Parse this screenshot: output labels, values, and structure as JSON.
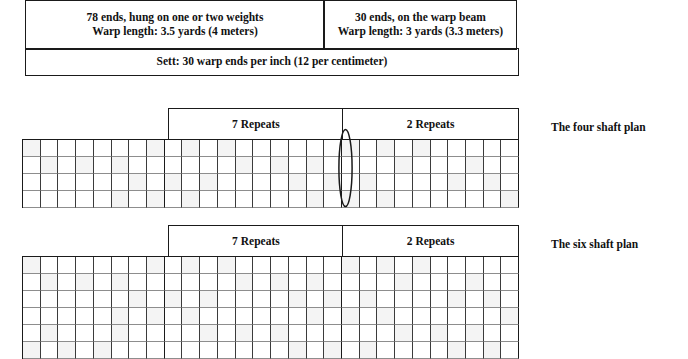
{
  "spec_table": {
    "warp_weighted": {
      "line1": "78 ends, hung on one or two weights",
      "line2": "Warp length: 3.5 yards (4 meters)"
    },
    "warp_beam": {
      "line1": "30 ends, on the warp beam",
      "line2": "Warp length: 3 yards (3.3 meters)"
    },
    "sett": "Sett: 30 warp ends per inch (12 per centimeter)"
  },
  "plans": [
    {
      "caption": "The four shaft plan",
      "shafts": 4,
      "repeats_left": "7 Repeats",
      "repeats_right": "2 Repeats",
      "columns_left_margin": 8,
      "columns_zone_a": 10,
      "columns_zone_b": 10,
      "has_marker_ellipse": true
    },
    {
      "caption": "The six shaft plan",
      "shafts": 6,
      "repeats_left": "7 Repeats",
      "repeats_right": "2 Repeats",
      "columns_left_margin": 8,
      "columns_zone_a": 10,
      "columns_zone_b": 10,
      "has_marker_ellipse": false
    }
  ],
  "colors": {
    "ink": "#1a1a1a",
    "grid_line": "#3b3b3b",
    "grid_line_light": "#8d8d8d",
    "cell_tint": "#f4f4f4",
    "paper": "#ffffff"
  }
}
